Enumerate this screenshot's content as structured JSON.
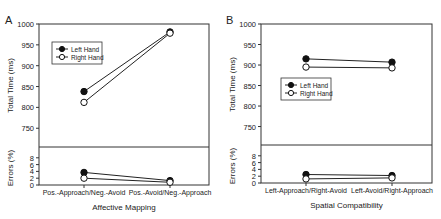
{
  "chart_data": [
    {
      "panel_label": "A",
      "type": "line",
      "xlabel": "Affective Mapping",
      "categories": [
        "Pos.-Approach/Neg.-Avoid",
        "Pos.-Avoid/Neg.-Approach"
      ],
      "top": {
        "ylabel": "Total Time (ms)",
        "yticks": [
          750,
          800,
          850,
          900,
          950,
          1000
        ],
        "ylim": [
          705,
          1000
        ],
        "series": [
          {
            "name": "Left Hand",
            "marker": "filled-circle",
            "values": [
              838,
              981
            ]
          },
          {
            "name": "Right Hand",
            "marker": "open-circle",
            "values": [
              812,
              978
            ]
          }
        ]
      },
      "bottom": {
        "ylabel": "Errors (%)",
        "yticks": [
          0,
          2,
          4,
          6,
          8
        ],
        "ylim": [
          0,
          10
        ],
        "series": [
          {
            "name": "Left Hand",
            "marker": "filled-circle",
            "values": [
              3.7,
              1.3
            ]
          },
          {
            "name": "Right Hand",
            "marker": "open-circle",
            "values": [
              2.0,
              0.8
            ]
          }
        ]
      },
      "legend": {
        "entries": [
          "Left Hand",
          "Right Hand"
        ],
        "position": "upper-left"
      }
    },
    {
      "panel_label": "B",
      "type": "line",
      "xlabel": "Spatial Compatibility",
      "categories": [
        "Left-Approach/Right-Avoid",
        "Left-Avoid/Right-Approach"
      ],
      "top": {
        "ylabel": "Total Time (ms)",
        "yticks": [
          750,
          800,
          850,
          900,
          950,
          1000
        ],
        "ylim": [
          705,
          1000
        ],
        "series": [
          {
            "name": "Left Hand",
            "marker": "filled-circle",
            "values": [
              915,
              907
            ]
          },
          {
            "name": "Right Hand",
            "marker": "open-circle",
            "values": [
              895,
              893
            ]
          }
        ]
      },
      "bottom": {
        "ylabel": "Errors (%)",
        "yticks": [
          0,
          2,
          4,
          6,
          8
        ],
        "ylim": [
          0,
          10
        ],
        "series": [
          {
            "name": "Left Hand",
            "marker": "filled-circle",
            "values": [
              2.5,
              2.2
            ]
          },
          {
            "name": "Right Hand",
            "marker": "open-circle",
            "values": [
              1.2,
              1.5
            ]
          }
        ]
      },
      "legend": {
        "entries": [
          "Left Hand",
          "Right Hand"
        ],
        "position": "middle-left"
      }
    }
  ]
}
